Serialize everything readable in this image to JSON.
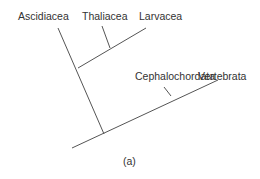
{
  "diagram": {
    "type": "cladogram",
    "taxa": [
      "Ascidiacea",
      "Thaliacea",
      "Larvacea",
      "Cephalochordata",
      "Vertebrata"
    ],
    "caption": "(a)",
    "line_color": "#555555",
    "text_color": "#333333"
  }
}
